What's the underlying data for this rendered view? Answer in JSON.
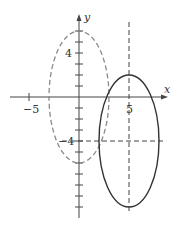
{
  "axes": {
    "x_label": "x",
    "y_label": "y",
    "x_ticks": [
      {
        "value": -5,
        "label": "−5"
      },
      {
        "value": 5,
        "label": "5"
      }
    ],
    "y_ticks": [
      {
        "value": 4,
        "label": "4"
      },
      {
        "value": -4,
        "label": "−4"
      }
    ],
    "x_range": [
      -7,
      8
    ],
    "y_range": [
      -10,
      8
    ],
    "origin_px": [
      79,
      97
    ],
    "px_per_x_unit": 10,
    "px_per_y_unit": 11
  },
  "curves": [
    {
      "name": "dashed-ellipse",
      "style": "dashed",
      "center": [
        0,
        0
      ],
      "rx": 3,
      "ry": 6,
      "color": "#8a8a8a"
    },
    {
      "name": "solid-ellipse",
      "style": "solid",
      "center": [
        5,
        -4
      ],
      "rx": 3,
      "ry": 6,
      "color": "#333333"
    }
  ],
  "guides": [
    {
      "name": "vertical-guide-x5",
      "orientation": "vertical",
      "value": 5
    },
    {
      "name": "horizontal-guide-y-4",
      "orientation": "horizontal",
      "value": -4
    }
  ]
}
